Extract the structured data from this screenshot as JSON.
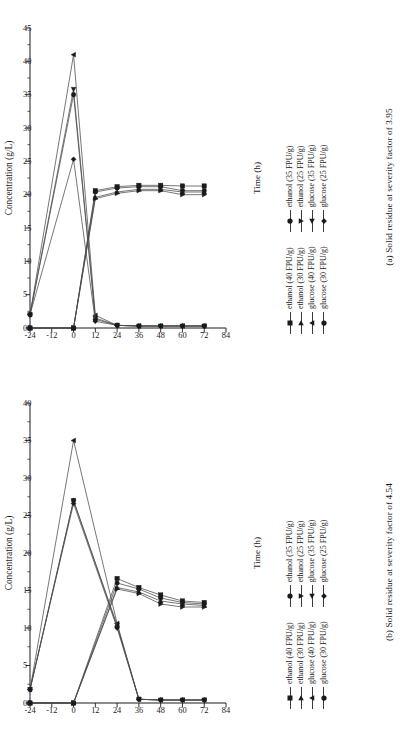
{
  "figure": {
    "axis_y_title": "Concentration (g/L)",
    "axis_x_title": "Time (h)",
    "series_names": [
      "ethanol (40 FPU/g)",
      "ethanol (35 FPU/g)",
      "ethanol (30 FPU/g)",
      "ethanol (25 FPU/g)",
      "glucose (40 FPU/g)",
      "glucose (35 FPU/g)",
      "glucose (30 FPU/g)",
      "glucose (25 FPU/g)"
    ],
    "markers": [
      "square",
      "circle",
      "triangle-right",
      "triangle-down",
      "triangle-up",
      "triangle-left",
      "circle",
      "diamond"
    ]
  },
  "panel_a": {
    "caption": "(a) Solid residue at severity factor of 3.95"
  },
  "panel_b": {
    "caption": "(b) Solid residue at severity factor of 4.54"
  },
  "chart_data": [
    {
      "type": "line",
      "panel": "a",
      "title": "(a) Solid residue at severity factor of 3.95",
      "xlabel": "Time (h)",
      "ylabel": "Concentration (g/L)",
      "xlim": [
        -24,
        84
      ],
      "ylim": [
        0,
        45
      ],
      "xticks": [
        -24,
        -12,
        0,
        12,
        24,
        36,
        48,
        60,
        72,
        84
      ],
      "yticks": [
        0,
        5,
        10,
        15,
        20,
        25,
        30,
        35,
        40,
        45
      ],
      "grid": false,
      "legend_position": "below",
      "x": [
        -24,
        0,
        12,
        24,
        36,
        48,
        60,
        72
      ],
      "series": [
        {
          "name": "ethanol (40 FPU/g)",
          "marker": "square",
          "values": [
            0.0,
            0.0,
            20.6,
            21.2,
            21.4,
            21.4,
            21.3,
            21.3
          ]
        },
        {
          "name": "ethanol (35 FPU/g)",
          "marker": "circle",
          "values": [
            0.0,
            0.0,
            20.4,
            21.0,
            21.2,
            21.2,
            20.6,
            20.6
          ]
        },
        {
          "name": "ethanol (30 FPU/g)",
          "marker": "triangle-right",
          "values": [
            0.0,
            0.0,
            19.6,
            20.4,
            20.8,
            20.8,
            20.4,
            20.4
          ]
        },
        {
          "name": "ethanol (25 FPU/g)",
          "marker": "triangle-down",
          "values": [
            0.0,
            0.0,
            19.4,
            20.2,
            20.6,
            20.6,
            20.0,
            20.0
          ]
        },
        {
          "name": "glucose (40 FPU/g)",
          "marker": "triangle-up",
          "values": [
            2.0,
            41.0,
            1.9,
            0.4,
            0.3,
            0.3,
            0.3,
            0.3
          ]
        },
        {
          "name": "glucose (35 FPU/g)",
          "marker": "triangle-left",
          "values": [
            2.0,
            35.8,
            1.5,
            0.4,
            0.3,
            0.3,
            0.3,
            0.3
          ]
        },
        {
          "name": "glucose (30 FPU/g)",
          "marker": "circle",
          "values": [
            2.0,
            35.0,
            1.3,
            0.4,
            0.3,
            0.3,
            0.3,
            0.3
          ]
        },
        {
          "name": "glucose (25 FPU/g)",
          "marker": "diamond",
          "values": [
            2.0,
            25.3,
            1.0,
            0.4,
            0.3,
            0.3,
            0.3,
            0.3
          ]
        }
      ]
    },
    {
      "type": "line",
      "panel": "b",
      "title": "(b) Solid residue at severity factor of 4.54",
      "xlabel": "Time (h)",
      "ylabel": "Concentration (g/L)",
      "xlim": [
        -24,
        84
      ],
      "ylim": [
        0,
        40
      ],
      "xticks": [
        -24,
        -12,
        0,
        12,
        24,
        36,
        48,
        60,
        72,
        84
      ],
      "yticks": [
        0,
        5,
        10,
        15,
        20,
        25,
        30,
        35,
        40
      ],
      "grid": false,
      "legend_position": "below",
      "x": [
        -24,
        0,
        24,
        36,
        48,
        60,
        72
      ],
      "series": [
        {
          "name": "ethanol (40 FPU/g)",
          "marker": "square",
          "values": [
            0.0,
            0.0,
            16.6,
            15.4,
            14.4,
            13.6,
            13.4
          ]
        },
        {
          "name": "ethanol (35 FPU/g)",
          "marker": "circle",
          "values": [
            0.0,
            0.0,
            16.0,
            15.2,
            14.0,
            13.4,
            13.2
          ]
        },
        {
          "name": "ethanol (30 FPU/g)",
          "marker": "triangle-right",
          "values": [
            0.0,
            0.0,
            15.4,
            14.8,
            13.6,
            13.2,
            13.0
          ]
        },
        {
          "name": "ethanol (25 FPU/g)",
          "marker": "triangle-down",
          "values": [
            0.0,
            0.0,
            15.2,
            14.6,
            13.2,
            12.8,
            12.8
          ]
        },
        {
          "name": "glucose (40 FPU/g)",
          "marker": "triangle-up",
          "values": [
            1.8,
            35.0,
            10.6,
            0.5,
            0.4,
            0.4,
            0.4
          ]
        },
        {
          "name": "glucose (35 FPU/g)",
          "marker": "triangle-left",
          "values": [
            1.8,
            27.0,
            10.4,
            0.5,
            0.4,
            0.4,
            0.4
          ]
        },
        {
          "name": "glucose (30 FPU/g)",
          "marker": "circle",
          "values": [
            1.8,
            27.0,
            10.2,
            0.5,
            0.4,
            0.4,
            0.4
          ]
        },
        {
          "name": "glucose (25 FPU/g)",
          "marker": "diamond",
          "values": [
            1.8,
            26.6,
            10.0,
            0.5,
            0.4,
            0.4,
            0.4
          ]
        }
      ]
    }
  ]
}
